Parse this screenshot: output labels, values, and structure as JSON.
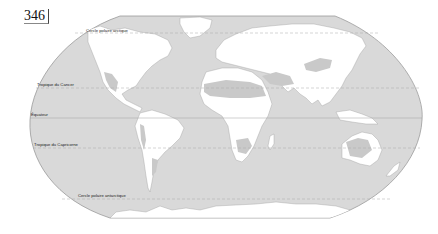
{
  "page": {
    "number": "346"
  },
  "map": {
    "projection": "Robinson-like world outline",
    "colors": {
      "ocean": "#d9d9d9",
      "land": "#ffffff",
      "highlighted_land": "#c9c9c9",
      "outline": "#9a9a9a",
      "latitude_line": "#a8a8a8"
    },
    "latitude_lines": [
      {
        "id": "arctic-circle",
        "label": "Cercle polaire arctique",
        "style": "dashed"
      },
      {
        "id": "tropic-of-cancer",
        "label": "Tropique du Cancer",
        "style": "dashed"
      },
      {
        "id": "equator",
        "label": "Équateur",
        "style": "solid"
      },
      {
        "id": "tropic-of-capricorn",
        "label": "Tropique du Capricorne",
        "style": "dashed"
      },
      {
        "id": "antarctic-circle",
        "label": "Cercle polaire antarctique",
        "style": "dashed"
      }
    ],
    "highlighted_regions": [
      "Sahara desert",
      "Arabian desert",
      "Gobi desert",
      "Kalahari desert",
      "Australian desert",
      "Patagonian desert",
      "North American desert",
      "Atacama desert"
    ]
  }
}
